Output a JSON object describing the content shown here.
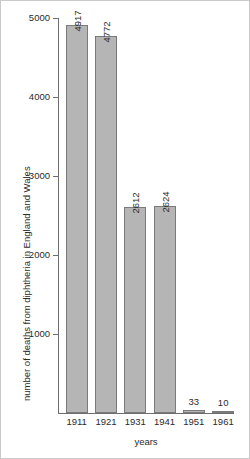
{
  "chart_data": {
    "type": "bar",
    "title": "",
    "xlabel": "years",
    "ylabel": "number of deaths from diphtheria in England and Wales",
    "categories": [
      "1911",
      "1921",
      "1931",
      "1941",
      "1951",
      "1961"
    ],
    "values": [
      4917,
      4772,
      2612,
      2624,
      33,
      10
    ],
    "value_labels": [
      "4917",
      "4772",
      "2612",
      "2624",
      "33",
      "10"
    ],
    "ylim": [
      0,
      5000
    ],
    "ytick_labels": [
      "1000",
      "2000",
      "3000",
      "4000",
      "5000"
    ],
    "ytick_values": [
      1000,
      2000,
      3000,
      4000,
      5000
    ],
    "grid": false,
    "legend": null,
    "bar_color": "#b5b5b5",
    "bar_border_color": "#7a7a7a",
    "axis_color": "#6e6e6e",
    "background": "#ffffff"
  }
}
